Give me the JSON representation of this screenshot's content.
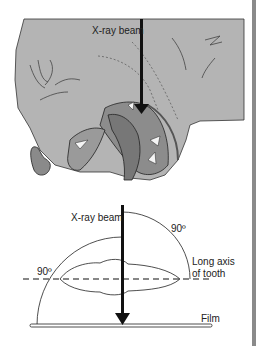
{
  "figure": {
    "top_panel": {
      "subject": "dog head with open mouth, lateral view",
      "beam_label": "X-ray beam"
    },
    "bottom_panel": {
      "beam_label": "X-ray beam",
      "angle_top": "90º",
      "angle_left": "90º",
      "axis_label_line1": "Long axis",
      "axis_label_line2": "of tooth",
      "film_label": "Film"
    },
    "colors": {
      "head_fill": "#b4b4b4",
      "mouth_fill": "#8c8c8c",
      "tongue_fill": "#777777",
      "line": "#111111",
      "border_bar": "#8a8a8a"
    }
  }
}
